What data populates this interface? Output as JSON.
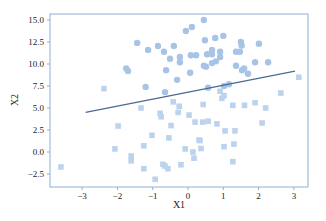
{
  "chart_data": {
    "type": "scatter",
    "title": "",
    "xlabel": "X1",
    "ylabel": "X2",
    "xlim": [
      -3.9,
      3.4
    ],
    "ylim": [
      -4.0,
      15.6
    ],
    "xticks": [
      -3,
      -2,
      -1,
      0,
      1,
      2,
      3
    ],
    "yticks": [
      -2.5,
      0.0,
      2.5,
      5.0,
      7.5,
      10.0,
      12.5,
      15.0
    ],
    "ytick_labels": [
      "-2.5",
      "0.0",
      "2.5",
      "5.0",
      "7.5",
      "10.0",
      "12.5",
      "15.0"
    ],
    "grid": false,
    "legend": null,
    "colors": {
      "class_circle": "#a7c4e6",
      "class_square": "#bcd3ee",
      "line": "#4a6a90",
      "frame": "#8fb0d6"
    },
    "series": [
      {
        "name": "class-1-circles",
        "marker": "circle",
        "points": [
          [
            0.45,
            15.0
          ],
          [
            0.11,
            14.2
          ],
          [
            -0.06,
            13.75
          ],
          [
            1.0,
            13.2
          ],
          [
            0.48,
            12.7
          ],
          [
            0.77,
            12.95
          ],
          [
            -1.44,
            12.4
          ],
          [
            -0.85,
            12.05
          ],
          [
            -0.4,
            12.05
          ],
          [
            -1.13,
            11.6
          ],
          [
            -0.68,
            11.4
          ],
          [
            0.68,
            11.6
          ],
          [
            0.91,
            11.4
          ],
          [
            1.5,
            12.5
          ],
          [
            1.52,
            12.1
          ],
          [
            2.01,
            12.3
          ],
          [
            0.54,
            11.1
          ],
          [
            0.68,
            11.1
          ],
          [
            0.91,
            10.8
          ],
          [
            1.36,
            11.4
          ],
          [
            1.47,
            11.4
          ],
          [
            -0.51,
            10.6
          ],
          [
            -0.23,
            10.8
          ],
          [
            -0.23,
            10.2
          ],
          [
            0.08,
            11.0
          ],
          [
            0.23,
            11.0
          ],
          [
            -1.75,
            9.5
          ],
          [
            -1.7,
            9.2
          ],
          [
            -0.62,
            9.3
          ],
          [
            0.06,
            9.0
          ],
          [
            0.45,
            9.8
          ],
          [
            0.51,
            9.7
          ],
          [
            0.68,
            10.1
          ],
          [
            0.79,
            10.3
          ],
          [
            1.36,
            9.8
          ],
          [
            1.59,
            9.5
          ],
          [
            1.53,
            9.3
          ],
          [
            1.9,
            10.2
          ],
          [
            2.27,
            10.2
          ],
          [
            1.7,
            8.9
          ],
          [
            1.16,
            7.7
          ],
          [
            0.57,
            7.3
          ],
          [
            1.02,
            7.5
          ],
          [
            -0.31,
            8.2
          ],
          [
            -1.2,
            7.4
          ],
          [
            -0.65,
            6.8
          ]
        ]
      },
      {
        "name": "class-2-squares",
        "marker": "square",
        "points": [
          [
            -3.6,
            -1.7
          ],
          [
            -2.38,
            7.2
          ],
          [
            3.14,
            8.5
          ],
          [
            2.63,
            6.7
          ],
          [
            -1.33,
            5.0
          ],
          [
            -0.79,
            4.4
          ],
          [
            -0.76,
            4.0
          ],
          [
            -0.42,
            5.7
          ],
          [
            -0.25,
            5.2
          ],
          [
            -0.28,
            4.5
          ],
          [
            0.43,
            5.4
          ],
          [
            0.91,
            6.9
          ],
          [
            1.02,
            6.4
          ],
          [
            0.96,
            6.1
          ],
          [
            1.27,
            5.3
          ],
          [
            1.6,
            5.3
          ],
          [
            1.9,
            5.6
          ],
          [
            2.2,
            5.0
          ],
          [
            0.42,
            3.4
          ],
          [
            0.03,
            4.2
          ],
          [
            0.2,
            3.4
          ],
          [
            -1.98,
            2.95
          ],
          [
            -1.02,
            1.9
          ],
          [
            -0.54,
            1.6
          ],
          [
            -0.48,
            3.0
          ],
          [
            0.57,
            3.5
          ],
          [
            0.82,
            3.2
          ],
          [
            1.05,
            2.4
          ],
          [
            1.33,
            2.4
          ],
          [
            2.1,
            3.3
          ],
          [
            1.02,
            0.6
          ],
          [
            1.3,
            0.9
          ],
          [
            0.37,
            0.4
          ],
          [
            -2.07,
            0.35
          ],
          [
            -1.61,
            -0.45
          ],
          [
            -1.61,
            -1.0
          ],
          [
            -1.25,
            0.7
          ],
          [
            -0.08,
            0.35
          ],
          [
            0.14,
            0.0
          ],
          [
            0.31,
            1.35
          ],
          [
            -0.71,
            -1.4
          ],
          [
            -0.65,
            -1.6
          ],
          [
            -0.57,
            -1.9
          ],
          [
            -0.2,
            -1.45
          ],
          [
            0.17,
            -0.7
          ],
          [
            -1.25,
            -1.9
          ],
          [
            -0.93,
            -3.1
          ],
          [
            1.27,
            -1.1
          ],
          [
            0.34,
            1.3
          ]
        ]
      }
    ],
    "line": {
      "name": "decision-boundary",
      "x": [
        -2.9,
        3.03
      ],
      "y": [
        4.5,
        9.2
      ]
    }
  }
}
